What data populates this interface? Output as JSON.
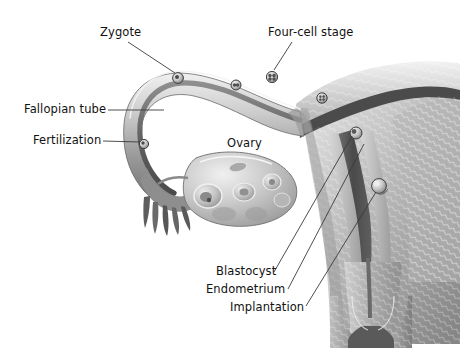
{
  "figure": {
    "background_color": "#ffffff",
    "ink_color": "#111111",
    "leader_line_color": "#3a3a3a",
    "palette": {
      "tissue_light": "#e3e3e3",
      "tissue_mid": "#b8b8b8",
      "tissue_dark": "#8c8c8c",
      "tissue_shadow": "#6b6b6b",
      "tissue_deep": "#4f4f4f",
      "outline": "#5a5a5a",
      "highlight": "#f2f2f2"
    }
  },
  "labels": {
    "zygote": "Zygote",
    "four_cell_stage": "Four-cell stage",
    "fallopian_tube": "Fallopian tube",
    "fertilization": "Fertilization",
    "ovary": "Ovary",
    "blastocyst": "Blastocyst",
    "endometrium": "Endometrium",
    "implantation": "Implantation"
  },
  "structures": [
    {
      "name": "fallopian-tube",
      "label": "Fallopian tube",
      "side": "left"
    },
    {
      "name": "fimbriae",
      "label": "",
      "side": "left"
    },
    {
      "name": "ovary",
      "label": "Ovary",
      "side": "left"
    },
    {
      "name": "uterus-body",
      "label": "",
      "side": "right"
    },
    {
      "name": "endometrium",
      "label": "Endometrium",
      "side": "right"
    },
    {
      "name": "myometrium",
      "label": "",
      "side": "right"
    },
    {
      "name": "cervix",
      "label": "",
      "side": "right"
    },
    {
      "name": "vagina",
      "label": "",
      "side": "right"
    }
  ],
  "developmental_stages": [
    {
      "name": "fertilization",
      "label": "Fertilization",
      "x": 144,
      "y": 144
    },
    {
      "name": "zygote",
      "label": "Zygote",
      "x": 178,
      "y": 78
    },
    {
      "name": "two-cell",
      "label": "",
      "x": 236,
      "y": 85
    },
    {
      "name": "four-cell-stage",
      "label": "Four-cell stage",
      "x": 272,
      "y": 77
    },
    {
      "name": "morula",
      "label": "",
      "x": 322,
      "y": 98
    },
    {
      "name": "blastocyst",
      "label": "Blastocyst",
      "x": 356,
      "y": 133
    },
    {
      "name": "implantation",
      "label": "Implantation",
      "x": 379,
      "y": 186
    }
  ]
}
